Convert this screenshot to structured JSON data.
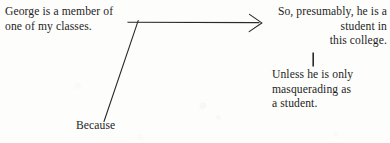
{
  "diagram": {
    "type": "argument-map",
    "background_color": "#fdfdfc",
    "ink_color": "#1f1f1f",
    "width": 390,
    "height": 143,
    "nodes": {
      "premise": {
        "role": "premise",
        "text": "George is a member of\none of my classes.",
        "align": "left"
      },
      "conclusion": {
        "role": "conclusion",
        "text": "So, presumably, he is a\nstudent in\nthis college.",
        "align": "right"
      },
      "qualifier": {
        "role": "rebuttal-qualifier",
        "text": "Unless he is only\nmasquerading  as\na student.",
        "align": "left"
      },
      "because": {
        "role": "connector-label",
        "text": "Because",
        "align": "left"
      }
    },
    "connectors": {
      "inference_arrow": {
        "name": "premise-to-conclusion-arrow",
        "style": "horizontal-line-with-arrowhead",
        "from_x": 128,
        "to_x": 262,
        "y": 22
      },
      "because_line": {
        "name": "because-diagonal-line",
        "style": "diagonal-line",
        "from_x": 138,
        "from_y": 22,
        "to_x": 104,
        "to_y": 121
      },
      "rebuttal_tick": {
        "name": "conclusion-to-qualifier-tick",
        "style": "vertical-line",
        "x": 313,
        "from_y": 52,
        "to_y": 66
      }
    }
  }
}
